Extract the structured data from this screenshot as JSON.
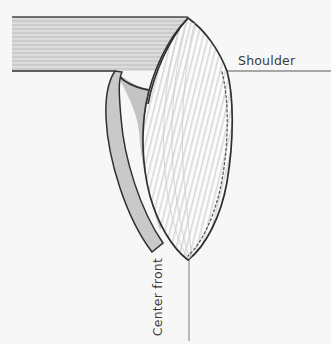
{
  "figure": {
    "type": "fashion-technical-illustration",
    "background_color": "#f7f7f7"
  },
  "labels": {
    "shoulder": "Shoulder",
    "center_front": "Center front"
  },
  "colors": {
    "outline": "#2f2f2f",
    "band_stripe_dark": "#cdcdcd",
    "band_stripe_light": "#dcdcdc",
    "band_fill": "#d4d4d4",
    "shadow_wedge": "#c4c4c4",
    "cowl_fill": "#fbfbfb",
    "cowl_stripe": "#d8d8d8",
    "fold_strip": "#c9c9c9",
    "label_text": "#3b3b3b",
    "guide_line": "#8d8d8d"
  },
  "elements": {
    "shoulder_band": "horizontal striped shoulder panel",
    "neckline_curve": "scooped neckline edge",
    "shadow_wedge": "gray under-drape shadow",
    "cowl_drape": "striped cowl drape panel",
    "cowl_seam": "dashed seam line on cowl",
    "fold_edge": "folded left edge strip",
    "shoulder_guide": "horizontal shoulder guide line",
    "center_front_guide": "vertical center front guide line"
  }
}
